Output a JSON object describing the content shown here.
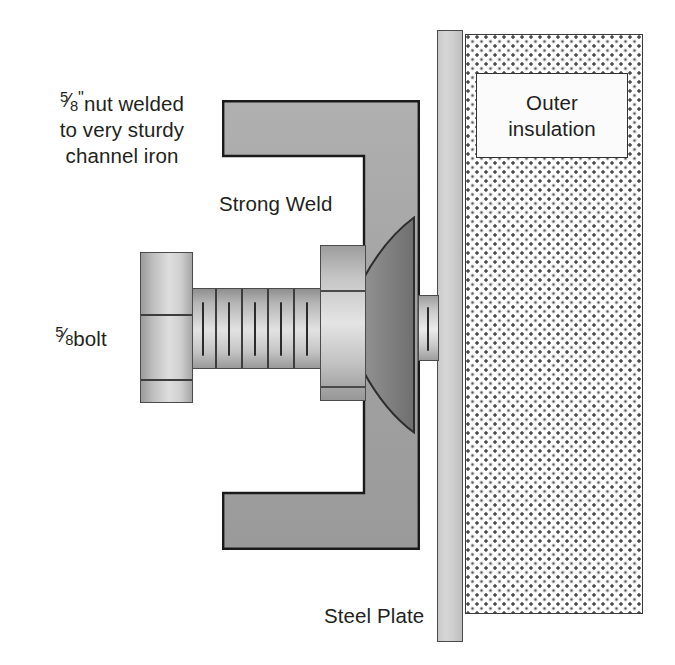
{
  "diagram": {
    "labels": {
      "nut_note_line1_prefix": "",
      "nut_note": "nut welded\nto very sturdy\nchannel iron",
      "nut_fraction_numerator": "5",
      "nut_fraction_denominator": "8",
      "nut_inch_mark": "\"",
      "bolt_label": "bolt",
      "bolt_fraction_numerator": "5",
      "bolt_fraction_denominator": "8",
      "strong_weld": "Strong Weld",
      "steel_plate": "Steel Plate",
      "outer_insulation": "Outer\ninsulation"
    },
    "parts": {
      "channel_iron": "channel-iron",
      "weld": "weld-bead",
      "bolt_head": "bolt-head",
      "bolt_shaft": "threaded-shaft",
      "nut_block": "welded-nut",
      "bolt_stub": "bolt-stub",
      "steel_plate": "steel-plate",
      "insulation": "outer-insulation"
    },
    "colors": {
      "metal_gray": "#a8a8a8",
      "channel_fill": "#a3a3a3",
      "channel_stroke": "#1a1a1a",
      "weld_fill": "#8c8c8c",
      "plate_fill": "#cfcfcf",
      "insulation_dots": "#4c4c4c",
      "text": "#231f20",
      "background": "#ffffff"
    }
  }
}
